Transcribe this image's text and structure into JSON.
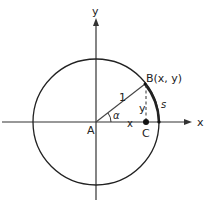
{
  "figure": {
    "axes": {
      "x_label": "x",
      "y_label": "y"
    },
    "points": {
      "origin": "A",
      "foot": "C",
      "on_circle": "B(x, y)"
    },
    "segments": {
      "radius": "1",
      "horizontal_leg": "x",
      "vertical_leg": "y"
    },
    "angle_label": "α",
    "arc_label": "s",
    "colors": {
      "stroke": "#222222",
      "axis": "#333333",
      "background": "#ffffff"
    }
  }
}
